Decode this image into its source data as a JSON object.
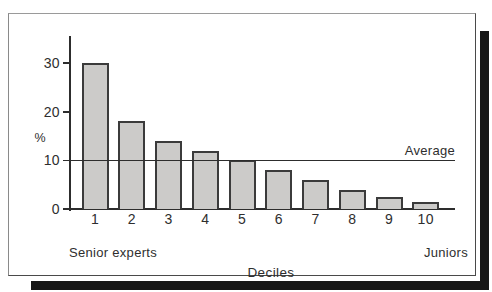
{
  "figure": {
    "unit_label": "%",
    "average_label": "Average",
    "x_axis_title": "Deciles",
    "left_group_label": "Senior experts",
    "right_group_label": "Juniors"
  },
  "chart_data": {
    "type": "bar",
    "categories": [
      "1",
      "2",
      "3",
      "4",
      "5",
      "6",
      "7",
      "8",
      "9",
      "10"
    ],
    "values": [
      30,
      18,
      14,
      12,
      10,
      8,
      6,
      4,
      2.5,
      1.5
    ],
    "title": "",
    "xlabel": "Deciles",
    "ylabel": "%",
    "ylim": [
      0,
      35
    ],
    "yticks": [
      0,
      10,
      20,
      30
    ],
    "average_line_value": 10,
    "average_line_label": "Average",
    "grid": "off",
    "annotations": [
      "Senior experts",
      "Juniors"
    ]
  },
  "colors": {
    "bar_fill": "#cccbc9",
    "bar_border": "#3b3b3b",
    "axis": "#2d2d2d",
    "text": "#2e2e2e",
    "shadow": "#161616"
  }
}
